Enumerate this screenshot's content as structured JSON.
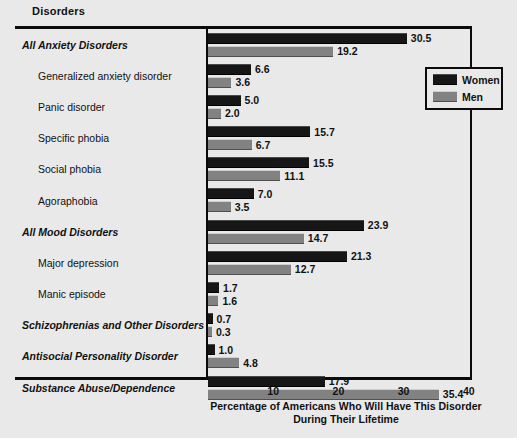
{
  "header": {
    "column_title": "Disorders"
  },
  "legend": {
    "position": "top-right",
    "entries": [
      {
        "label": "Women",
        "color": "#161616",
        "swatch": "women-swatch"
      },
      {
        "label": "Men",
        "color": "#828282",
        "swatch": "men-swatch"
      }
    ]
  },
  "axis": {
    "ticks": [
      "10",
      "20",
      "30",
      "40"
    ],
    "caption_line1": "Percentage of Americans Who Will Have This Disorder",
    "caption_line2": "During Their Lifetime"
  },
  "chart_data": {
    "type": "bar",
    "orientation": "horizontal",
    "title": "",
    "xlabel": "Percentage of Americans Who Will Have This Disorder During Their Lifetime",
    "ylabel": "Disorders",
    "xlim": [
      0,
      43
    ],
    "xticks": [
      10,
      20,
      30,
      40
    ],
    "grid": false,
    "legend_position": "top-right",
    "categories": [
      "All Anxiety Disorders",
      "Generalized anxiety disorder",
      "Panic disorder",
      "Specific phobia",
      "Social phobia",
      "Agoraphobia",
      "All Mood Disorders",
      "Major depression",
      "Manic episode",
      "Schizophrenias and Other Disorders",
      "Antisocial Personality Disorder",
      "Substance Abuse/Dependence"
    ],
    "category_levels": [
      "major",
      "sub",
      "sub",
      "sub",
      "sub",
      "sub",
      "major",
      "sub",
      "sub",
      "major",
      "major",
      "major"
    ],
    "series": [
      {
        "name": "Women",
        "color": "#161616",
        "values": [
          30.5,
          6.6,
          5.0,
          15.7,
          15.5,
          7.0,
          23.9,
          21.3,
          1.7,
          0.7,
          1.0,
          17.9
        ],
        "labels": [
          "30.5",
          "6.6",
          "5.0",
          "15.7",
          "15.5",
          "7.0",
          "23.9",
          "21.3",
          "1.7",
          "0.7",
          "1.0",
          "17.9"
        ]
      },
      {
        "name": "Men",
        "color": "#828282",
        "values": [
          19.2,
          3.6,
          2.0,
          6.7,
          11.1,
          3.5,
          14.7,
          12.7,
          1.6,
          0.3,
          4.8,
          35.4
        ],
        "labels": [
          "19.2",
          "3.6",
          "2.0",
          "6.7",
          "11.1",
          "3.5",
          "14.7",
          "12.7",
          "1.6",
          "0.3",
          "4.8",
          "35.4"
        ]
      }
    ]
  },
  "colors": {
    "background": "#e9e9e9",
    "ink": "#0b0b0b",
    "women": "#161616",
    "men": "#828282"
  }
}
